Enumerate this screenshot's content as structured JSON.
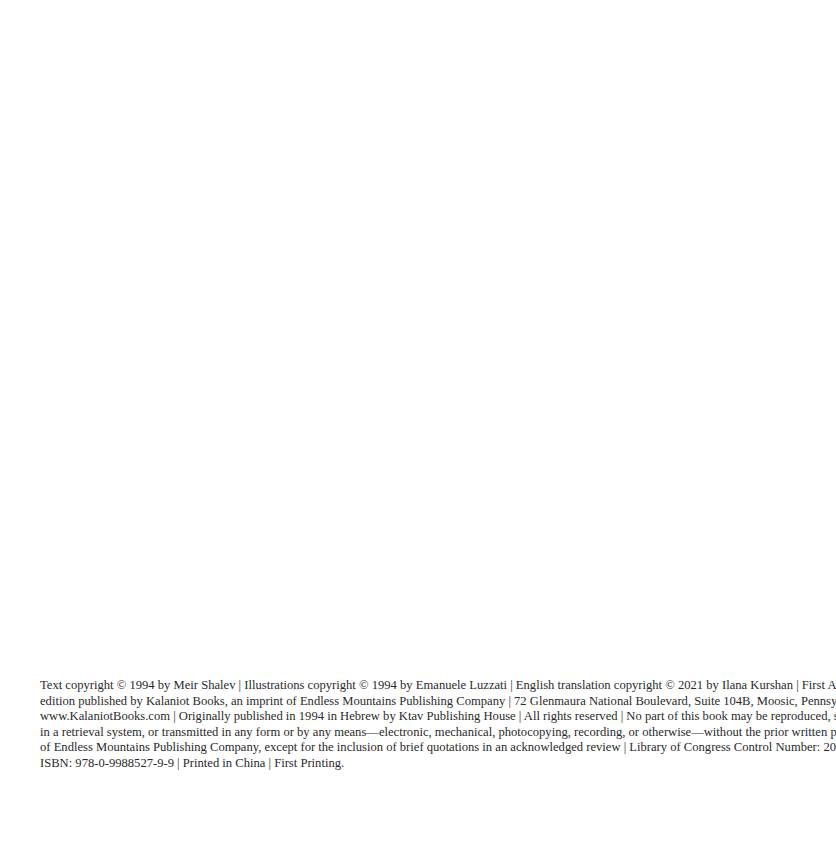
{
  "copyright_page": {
    "lines": [
      "Text copyright © 1994 by Meir Shalev  |  Illustrations copyright © 1994 by Emanuele Luzzati  |  English translation copyright © 2021 by Ilana Kurshan  |  First American",
      "edition published by Kalaniot Books, an imprint of Endless Mountains Publishing Company | 72 Glenmaura National Boulevard, Suite 104B, Moosic, Pennsylvania 18507",
      "www.KalaniotBooks.com  |  Originally published in 1994 in Hebrew by Ktav Publishing House  |  All rights reserved  |  No part of this book may be reproduced, stored",
      "in a retrieval system, or transmitted in any form or by any means—electronic, mechanical, photocopying, recording, or otherwise—without the prior written permission",
      "of Endless Mountains Publishing Company, except for the inclusion of brief quotations in an acknowledged review  |  Library of Congress Control Number: 2020935267",
      "ISBN: 978-0-9988527-9-9  |  Printed in China  |  First Printing."
    ],
    "fields": {
      "text_copyright": "Text copyright © 1994 by Meir Shalev",
      "illustrations_copyright": "Illustrations copyright © 1994 by Emanuele Luzzati",
      "translation_copyright": "English translation copyright © 2021 by Ilana Kurshan",
      "edition": "First American edition published by Kalaniot Books, an imprint of Endless Mountains Publishing Company",
      "address": "72 Glenmaura National Boulevard, Suite 104B, Moosic, Pennsylvania 18507",
      "website": "www.KalaniotBooks.com",
      "original_publication": "Originally published in 1994 in Hebrew by Ktav Publishing House",
      "rights": "All rights reserved",
      "lccn": "2020935267",
      "isbn": "978-0-9988527-9-9",
      "printed_in": "Printed in China",
      "printing": "First Printing."
    }
  }
}
